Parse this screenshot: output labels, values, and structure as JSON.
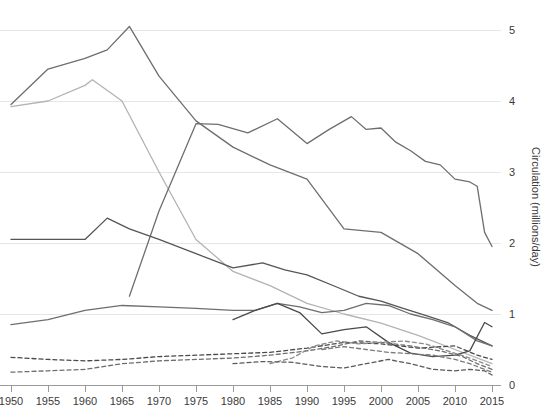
{
  "chart_data": {
    "type": "line",
    "title": "",
    "subtitle": "",
    "xlabel": "",
    "ylabel": "Circulation (millions/day)",
    "xlim": [
      1950,
      2016
    ],
    "ylim": [
      0,
      5.35
    ],
    "grid": true,
    "grid_axis": "y",
    "legend": "none",
    "xticks": [
      1950,
      1955,
      1960,
      1965,
      1970,
      1975,
      1980,
      1985,
      1990,
      1995,
      2000,
      2005,
      2010,
      2015
    ],
    "xtick_labels": [
      "1950",
      "1955",
      "1960",
      "1965",
      "1970",
      "1975",
      "1980",
      "1985",
      "1990",
      "1995",
      "2000",
      "2005",
      "2010",
      "2015"
    ],
    "yticks": [
      0,
      1,
      2,
      3,
      4,
      5
    ],
    "ytick_labels": [
      "0",
      "1",
      "2",
      "3",
      "4",
      "5"
    ],
    "y_axis_position": "right",
    "series": [
      {
        "name": "series-1",
        "style": "solid",
        "color": "#6e6e6e",
        "width": 1.3,
        "x": [
          1950,
          1955,
          1960,
          1963,
          1966,
          1970,
          1975,
          1980,
          1985,
          1990,
          1995,
          2000,
          2005,
          2010,
          2013,
          2015
        ],
        "values": [
          3.95,
          4.45,
          4.6,
          4.72,
          5.05,
          4.35,
          3.72,
          3.35,
          3.1,
          2.9,
          2.2,
          2.15,
          1.85,
          1.4,
          1.15,
          1.05
        ]
      },
      {
        "name": "series-2",
        "style": "solid",
        "color": "#b3b3b3",
        "width": 1.3,
        "x": [
          1950,
          1955,
          1960,
          1961,
          1965,
          1970,
          1975,
          1980,
          1985,
          1990,
          1995,
          2000,
          2005,
          2010,
          2015
        ],
        "values": [
          3.92,
          4.0,
          4.22,
          4.3,
          4.0,
          3.0,
          2.05,
          1.6,
          1.4,
          1.15,
          1.0,
          0.87,
          0.7,
          0.5,
          0.3
        ]
      },
      {
        "name": "series-3",
        "style": "solid",
        "color": "#6e6e6e",
        "width": 1.3,
        "x": [
          1966,
          1970,
          1975,
          1978,
          1982,
          1986,
          1990,
          1993,
          1996,
          1998,
          2000,
          2002,
          2004,
          2006,
          2008,
          2010,
          2012,
          2013,
          2014,
          2015
        ],
        "values": [
          1.25,
          2.45,
          3.68,
          3.67,
          3.55,
          3.75,
          3.4,
          3.6,
          3.78,
          3.6,
          3.62,
          3.42,
          3.3,
          3.15,
          3.1,
          2.9,
          2.86,
          2.8,
          2.15,
          1.95
        ]
      },
      {
        "name": "series-4",
        "style": "solid",
        "color": "#555555",
        "width": 1.3,
        "x": [
          1950,
          1955,
          1960,
          1963,
          1966,
          1970,
          1975,
          1980,
          1984,
          1987,
          1990,
          1994,
          1997,
          2000,
          2003,
          2006,
          2009,
          2012,
          2014,
          2015
        ],
        "values": [
          2.05,
          2.05,
          2.05,
          2.35,
          2.2,
          2.05,
          1.85,
          1.65,
          1.72,
          1.62,
          1.55,
          1.38,
          1.25,
          1.18,
          1.08,
          0.98,
          0.88,
          0.7,
          0.6,
          0.55
        ]
      },
      {
        "name": "series-5",
        "style": "solid",
        "color": "#6e6e6e",
        "width": 1.3,
        "x": [
          1950,
          1955,
          1960,
          1965,
          1970,
          1975,
          1980,
          1983,
          1986,
          1989,
          1992,
          1995,
          1998,
          2001,
          2004,
          2007,
          2010,
          2013,
          2015
        ],
        "values": [
          0.85,
          0.92,
          1.05,
          1.12,
          1.1,
          1.08,
          1.05,
          1.05,
          1.15,
          1.1,
          1.02,
          1.05,
          1.15,
          1.12,
          1.0,
          0.92,
          0.82,
          0.62,
          0.55
        ]
      },
      {
        "name": "series-6",
        "style": "solid",
        "color": "#4a4a4a",
        "width": 1.3,
        "x": [
          1980,
          1983,
          1986,
          1989,
          1992,
          1995,
          1998,
          2001,
          2004,
          2007,
          2010,
          2012,
          2014,
          2015
        ],
        "values": [
          0.92,
          1.05,
          1.15,
          1.02,
          0.72,
          0.78,
          0.82,
          0.6,
          0.45,
          0.4,
          0.42,
          0.48,
          0.88,
          0.82
        ]
      },
      {
        "name": "series-7",
        "style": "dashed",
        "color": "#4a4a4a",
        "width": 1.3,
        "x": [
          1950,
          1955,
          1960,
          1965,
          1970,
          1975,
          1980,
          1985,
          1990,
          1995,
          2000,
          2005,
          2010,
          2013,
          2015
        ],
        "values": [
          0.39,
          0.36,
          0.34,
          0.36,
          0.4,
          0.42,
          0.44,
          0.46,
          0.52,
          0.6,
          0.58,
          0.52,
          0.55,
          0.42,
          0.36
        ]
      },
      {
        "name": "series-8",
        "style": "dashed",
        "color": "#6e6e6e",
        "width": 1.3,
        "x": [
          1950,
          1955,
          1960,
          1965,
          1970,
          1975,
          1980,
          1985,
          1990,
          1994,
          1997,
          2000,
          2004,
          2008,
          2011,
          2013,
          2015
        ],
        "values": [
          0.18,
          0.2,
          0.22,
          0.3,
          0.34,
          0.36,
          0.38,
          0.42,
          0.48,
          0.55,
          0.62,
          0.6,
          0.55,
          0.48,
          0.4,
          0.3,
          0.22
        ]
      },
      {
        "name": "series-9",
        "style": "dashed",
        "color": "#8a8a8a",
        "width": 1.3,
        "x": [
          1985,
          1988,
          1991,
          1994,
          1997,
          2000,
          2003,
          2006,
          2009,
          2012,
          2014,
          2015
        ],
        "values": [
          0.3,
          0.38,
          0.55,
          0.62,
          0.58,
          0.6,
          0.62,
          0.58,
          0.48,
          0.38,
          0.3,
          0.26
        ]
      },
      {
        "name": "series-10",
        "style": "dashed",
        "color": "#5a5a5a",
        "width": 1.3,
        "x": [
          1980,
          1984,
          1988,
          1992,
          1995,
          1998,
          2001,
          2004,
          2007,
          2010,
          2012,
          2014,
          2015
        ],
        "values": [
          0.3,
          0.33,
          0.32,
          0.26,
          0.24,
          0.3,
          0.36,
          0.3,
          0.22,
          0.2,
          0.22,
          0.2,
          0.14
        ]
      },
      {
        "name": "series-11",
        "style": "dashed",
        "color": "#7a7a7a",
        "width": 1.3,
        "x": [
          1992,
          1995,
          1998,
          2001,
          2004,
          2007,
          2010,
          2012,
          2014,
          2015
        ],
        "values": [
          0.5,
          0.54,
          0.5,
          0.46,
          0.44,
          0.42,
          0.36,
          0.3,
          0.22,
          0.18
        ]
      }
    ]
  },
  "axes": {
    "y_axis_title": "Circulation (millions/day)"
  }
}
